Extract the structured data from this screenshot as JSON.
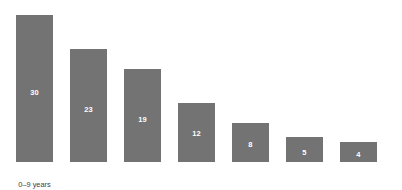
{
  "chart_data": {
    "type": "bar",
    "title": "",
    "subtitle": "",
    "xlabel": "",
    "ylabel": "",
    "grid": false,
    "legend": false,
    "axes_visible": false,
    "orientation": "vertical",
    "bar_color": "#737373",
    "value_label_color": "#ffffff",
    "tick_label_color": "#3f3f3f",
    "background_color": "#ffffff",
    "ylim": [
      0,
      30
    ],
    "categories": [
      "0–9 years",
      "10–19 years",
      "20–29 years",
      "30–39 years",
      "40–49 years",
      "50–59 years",
      "Over 60s"
    ],
    "values": [
      30,
      23,
      19,
      12,
      8,
      5,
      4
    ],
    "value_labels": [
      "30",
      "23",
      "19",
      "12",
      "8",
      "5",
      "4"
    ],
    "bars": [
      {
        "category": "0–9 years",
        "value": 30,
        "label": "30"
      },
      {
        "category": "10–19 years",
        "value": 23,
        "label": "23"
      },
      {
        "category": "20–29 years",
        "value": 19,
        "label": "19"
      },
      {
        "category": "30–39 years",
        "value": 12,
        "label": "12"
      },
      {
        "category": "40–49 years",
        "value": 8,
        "label": "8"
      },
      {
        "category": "50–59 years",
        "value": 5,
        "label": "5"
      },
      {
        "category": "Over 60s",
        "value": 4,
        "label": "4"
      }
    ]
  }
}
